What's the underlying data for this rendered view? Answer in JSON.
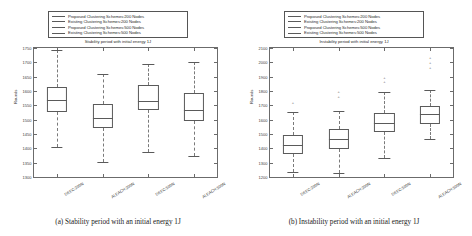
{
  "figure": {
    "panels": [
      {
        "id": "panel-a",
        "caption": "(a) Stability period with an initial energy 1J",
        "title": "Stability period with initial energy 1J",
        "ylabel": "Rounds",
        "legend": [
          "Proposed Clustering Schemes:200 Nodes",
          "Existing Clustering Schemes:200 Nodes",
          "Proposed Clustering Schemes:500 Nodes",
          "Existing Clustering Schemes:500 Nodes"
        ],
        "chart_data": {
          "type": "box",
          "title": "Stability period with initial energy 1J",
          "xlabel": "",
          "ylabel": "Rounds",
          "ylim": [
            1300,
            1750
          ],
          "yticks": [
            1300,
            1350,
            1400,
            1450,
            1500,
            1550,
            1600,
            1650,
            1700,
            1750
          ],
          "grid": false,
          "legend_position": "above-axes",
          "categories": [
            "DEEC:200N",
            "ALEACH:200N",
            "DEEC:500N",
            "ALEACH:500N"
          ],
          "boxes": [
            {
              "label": "DEEC:200N",
              "whisker_low": 1404,
              "q1": 1528,
              "median": 1567,
              "q3": 1615,
              "whisker_high": 1744,
              "outliers": []
            },
            {
              "label": "ALEACH:200N",
              "whisker_low": 1351,
              "q1": 1470,
              "median": 1505,
              "q3": 1554,
              "whisker_high": 1661,
              "outliers": []
            },
            {
              "label": "DEEC:500N",
              "whisker_low": 1386,
              "q1": 1533,
              "median": 1565,
              "q3": 1620,
              "whisker_high": 1693,
              "outliers": []
            },
            {
              "label": "ALEACH:500N",
              "whisker_low": 1372,
              "q1": 1494,
              "median": 1535,
              "q3": 1592,
              "whisker_high": 1701,
              "outliers": []
            }
          ]
        }
      },
      {
        "id": "panel-b",
        "caption": "(b) Instability period with an initial energy 1J",
        "title": "Instability period with initial energy 1J",
        "ylabel": "Rounds",
        "legend": [
          "Proposed Clustering Schemes:200 Nodes",
          "Existing Clustering Schemes:200 Nodes",
          "Proposed Clustering Schemes:500 Nodes",
          "Existing Clustering Schemes:500 Nodes"
        ],
        "chart_data": {
          "type": "box",
          "title": "Instability period with initial energy 1J",
          "xlabel": "",
          "ylabel": "Rounds",
          "ylim": [
            1200,
            2100
          ],
          "yticks": [
            1200,
            1300,
            1400,
            1500,
            1600,
            1700,
            1800,
            1900,
            2000,
            2100
          ],
          "grid": false,
          "legend_position": "above-axes",
          "categories": [
            "DEEC:200N",
            "ALEACH:200N",
            "DEEC:500N",
            "ALEACH:500N"
          ],
          "boxes": [
            {
              "label": "DEEC:200N",
              "whisker_low": 1232,
              "q1": 1358,
              "median": 1420,
              "q3": 1496,
              "whisker_high": 1652,
              "outliers": [
                1726
              ]
            },
            {
              "label": "ALEACH:200N",
              "whisker_low": 1228,
              "q1": 1398,
              "median": 1462,
              "q3": 1534,
              "whisker_high": 1658,
              "outliers": [
                1768,
                1800
              ]
            },
            {
              "label": "DEEC:500N",
              "whisker_low": 1331,
              "q1": 1516,
              "median": 1577,
              "q3": 1646,
              "whisker_high": 1790,
              "outliers": [
                1872,
                1896
              ]
            },
            {
              "label": "ALEACH:500N",
              "whisker_low": 1463,
              "q1": 1570,
              "median": 1637,
              "q3": 1694,
              "whisker_high": 1806,
              "outliers": [
                1966,
                2004,
                2038
              ]
            }
          ]
        }
      }
    ]
  }
}
